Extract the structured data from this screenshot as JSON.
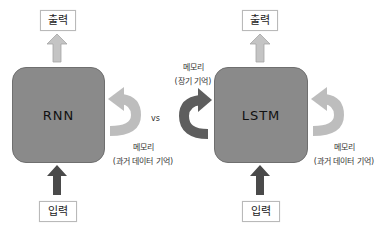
{
  "rnn": {
    "block_label": "RNN",
    "output_label": "출력",
    "input_label": "입력",
    "memory_label_line1": "메모리",
    "memory_label_line2": "(과거 데이터 기억)"
  },
  "separator": "vs",
  "lstm": {
    "block_label": "LSTM",
    "output_label": "출력",
    "input_label": "입력",
    "long_term_label_line1": "메모리",
    "long_term_label_line2": "(장기 기억)",
    "memory_label_line1": "메모리",
    "memory_label_line2": "(과거 데이터 기억)"
  },
  "colors": {
    "block": "#8a8a8a",
    "output_arrow": "#c4c4c4",
    "input_arrow": "#4a4a4a",
    "loop_arrow": "#bdbdbd",
    "long_term_arrow": "#5e5e5e"
  }
}
